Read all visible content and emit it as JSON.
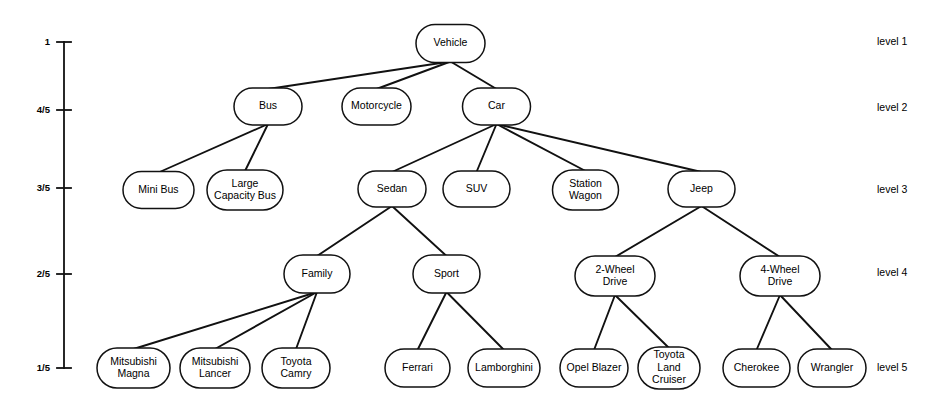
{
  "figure": {
    "kind": "hierarchy-tree-diagram",
    "background_color": "#ffffff",
    "stroke_color": "#111111",
    "text_color": "#000000",
    "width": 937,
    "height": 413
  },
  "axis": {
    "name": "membership-axis",
    "x": 64,
    "top": 42,
    "bottom": 368,
    "tick_half_width": 7,
    "ticks": [
      {
        "label": "1",
        "y": 42
      },
      {
        "label": "4/5",
        "y": 110
      },
      {
        "label": "3/5",
        "y": 188
      },
      {
        "label": "2/5",
        "y": 274
      },
      {
        "label": "1/5",
        "y": 368
      }
    ]
  },
  "level_labels": [
    {
      "label": "level 1",
      "x": 877,
      "y": 42
    },
    {
      "label": "level 2",
      "x": 877,
      "y": 108
    },
    {
      "label": "level 3",
      "x": 877,
      "y": 190
    },
    {
      "label": "level 4",
      "x": 877,
      "y": 273
    },
    {
      "label": "level 5",
      "x": 877,
      "y": 368
    }
  ],
  "nodes": [
    {
      "id": "vehicle",
      "lines": [
        "Vehicle"
      ],
      "level": 1,
      "cx": 450.5,
      "cy": 43.5,
      "w": 69,
      "h": 38
    },
    {
      "id": "bus",
      "lines": [
        "Bus"
      ],
      "level": 2,
      "cx": 268.0,
      "cy": 106.5,
      "w": 68,
      "h": 37
    },
    {
      "id": "motorcycle",
      "lines": [
        "Motorcycle"
      ],
      "level": 2,
      "cx": 376.5,
      "cy": 106.5,
      "w": 69,
      "h": 37
    },
    {
      "id": "car",
      "lines": [
        "Car"
      ],
      "level": 2,
      "cx": 496.5,
      "cy": 106.5,
      "w": 68,
      "h": 37
    },
    {
      "id": "mini-bus",
      "lines": [
        "Mini Bus"
      ],
      "level": 3,
      "cx": 158.5,
      "cy": 190.0,
      "w": 71,
      "h": 37
    },
    {
      "id": "large-cap-bus",
      "lines": [
        "Large",
        "Capacity Bus"
      ],
      "level": 3,
      "cx": 245.0,
      "cy": 190.0,
      "w": 76,
      "h": 40
    },
    {
      "id": "sedan",
      "lines": [
        "Sedan"
      ],
      "level": 3,
      "cx": 392.0,
      "cy": 189.0,
      "w": 68,
      "h": 36
    },
    {
      "id": "suv",
      "lines": [
        "SUV"
      ],
      "level": 3,
      "cx": 476.5,
      "cy": 189.0,
      "w": 67,
      "h": 36
    },
    {
      "id": "station-wagon",
      "lines": [
        "Station",
        "Wagon"
      ],
      "level": 3,
      "cx": 585.5,
      "cy": 190.0,
      "w": 66,
      "h": 40
    },
    {
      "id": "jeep",
      "lines": [
        "Jeep"
      ],
      "level": 3,
      "cx": 701.5,
      "cy": 189.0,
      "w": 67,
      "h": 36
    },
    {
      "id": "family",
      "lines": [
        "Family"
      ],
      "level": 4,
      "cx": 317.0,
      "cy": 274.0,
      "w": 66,
      "h": 38
    },
    {
      "id": "sport",
      "lines": [
        "Sport"
      ],
      "level": 4,
      "cx": 446.5,
      "cy": 274.0,
      "w": 67,
      "h": 38
    },
    {
      "id": "two-wheel",
      "lines": [
        "2-Wheel",
        "Drive"
      ],
      "level": 4,
      "cx": 615.0,
      "cy": 276.0,
      "w": 80,
      "h": 40
    },
    {
      "id": "four-wheel",
      "lines": [
        "4-Wheel",
        "Drive"
      ],
      "level": 4,
      "cx": 780.0,
      "cy": 276.0,
      "w": 80,
      "h": 40
    },
    {
      "id": "mitsu-magna",
      "lines": [
        "Mitsubishi",
        "Magna"
      ],
      "level": 5,
      "cx": 133.5,
      "cy": 368.0,
      "w": 73,
      "h": 40
    },
    {
      "id": "mitsu-lancer",
      "lines": [
        "Mitsubishi",
        "Lancer"
      ],
      "level": 5,
      "cx": 215.0,
      "cy": 368.0,
      "w": 70,
      "h": 40
    },
    {
      "id": "toyota-camry",
      "lines": [
        "Toyota",
        "Camry"
      ],
      "level": 5,
      "cx": 296.0,
      "cy": 368.0,
      "w": 68,
      "h": 40
    },
    {
      "id": "ferrari",
      "lines": [
        "Ferrari"
      ],
      "level": 5,
      "cx": 417.5,
      "cy": 368.0,
      "w": 65,
      "h": 38
    },
    {
      "id": "lamborghini",
      "lines": [
        "Lamborghini"
      ],
      "level": 5,
      "cx": 504.0,
      "cy": 368.0,
      "w": 72,
      "h": 38
    },
    {
      "id": "opel-blazer",
      "lines": [
        "Opel Blazer"
      ],
      "level": 5,
      "cx": 594.0,
      "cy": 368.0,
      "w": 68,
      "h": 38
    },
    {
      "id": "toyota-lc",
      "lines": [
        "Toyota",
        "Land",
        "Cruiser"
      ],
      "level": 5,
      "cx": 669.0,
      "cy": 368.0,
      "w": 62,
      "h": 42
    },
    {
      "id": "cherokee",
      "lines": [
        "Cherokee"
      ],
      "level": 5,
      "cx": 756.5,
      "cy": 368.0,
      "w": 67,
      "h": 38
    },
    {
      "id": "wrangler",
      "lines": [
        "Wrangler"
      ],
      "level": 5,
      "cx": 832.0,
      "cy": 368.0,
      "w": 68,
      "h": 38
    }
  ],
  "edges": [
    {
      "from": "vehicle",
      "to": "bus"
    },
    {
      "from": "vehicle",
      "to": "motorcycle"
    },
    {
      "from": "vehicle",
      "to": "car"
    },
    {
      "from": "bus",
      "to": "mini-bus"
    },
    {
      "from": "bus",
      "to": "large-cap-bus"
    },
    {
      "from": "car",
      "to": "sedan"
    },
    {
      "from": "car",
      "to": "suv"
    },
    {
      "from": "car",
      "to": "station-wagon"
    },
    {
      "from": "car",
      "to": "jeep"
    },
    {
      "from": "sedan",
      "to": "family"
    },
    {
      "from": "sedan",
      "to": "sport"
    },
    {
      "from": "jeep",
      "to": "two-wheel"
    },
    {
      "from": "jeep",
      "to": "four-wheel"
    },
    {
      "from": "family",
      "to": "mitsu-magna"
    },
    {
      "from": "family",
      "to": "mitsu-lancer"
    },
    {
      "from": "family",
      "to": "toyota-camry"
    },
    {
      "from": "sport",
      "to": "ferrari"
    },
    {
      "from": "sport",
      "to": "lamborghini"
    },
    {
      "from": "two-wheel",
      "to": "opel-blazer"
    },
    {
      "from": "two-wheel",
      "to": "toyota-lc"
    },
    {
      "from": "four-wheel",
      "to": "cherokee"
    },
    {
      "from": "four-wheel",
      "to": "wrangler"
    }
  ]
}
